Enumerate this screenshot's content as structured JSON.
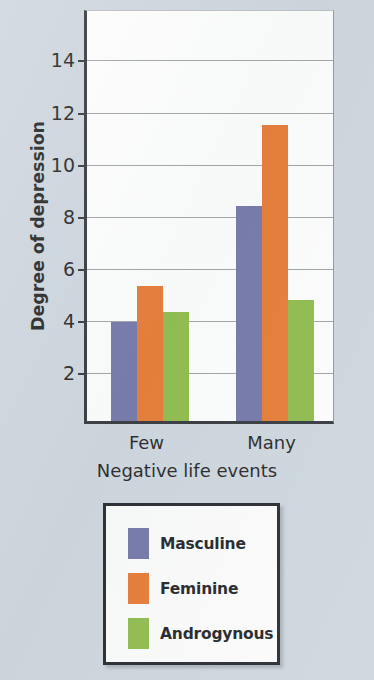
{
  "chart_data": {
    "type": "bar",
    "title": "",
    "xlabel": "Negative life events",
    "ylabel": "Degree of depression",
    "categories": [
      "Few",
      "Many"
    ],
    "series": [
      {
        "name": "Masculine",
        "color": "#6d71a4",
        "values": [
          3.8,
          8.25
        ]
      },
      {
        "name": "Feminine",
        "color": "#e6742b",
        "values": [
          5.2,
          11.35
        ]
      },
      {
        "name": "Androgynous",
        "color": "#8ab843",
        "values": [
          4.2,
          4.65
        ]
      }
    ],
    "ylim": [
      0,
      15.9
    ],
    "yticks": [
      2,
      4,
      6,
      8,
      10,
      12,
      14
    ],
    "ytick_labels": [
      "2",
      "4",
      "6",
      "8",
      "10",
      "12",
      "14"
    ],
    "grid": true,
    "legend_position": "below-plot"
  },
  "figure": {
    "background_color": "#ccd4dc",
    "plot_background_color": "#fdfdfc",
    "axis_color": "#2c2f35",
    "grid_color": "#9b9fa4"
  },
  "legend": {
    "entries": [
      {
        "label": "Masculine",
        "color": "#6d71a4"
      },
      {
        "label": "Feminine",
        "color": "#e6742b"
      },
      {
        "label": "Androgynous",
        "color": "#8ab843"
      }
    ]
  }
}
